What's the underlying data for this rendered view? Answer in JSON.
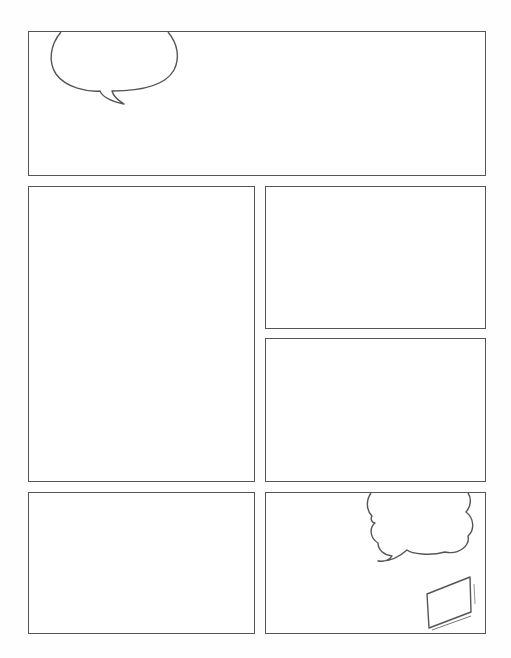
{
  "page": {
    "type": "comic-page-template",
    "background": "#ffffff",
    "line_color": "#555555"
  },
  "panels": [
    {
      "id": "panel-1",
      "x": 28,
      "y": 31,
      "w": 458,
      "h": 145,
      "contents": [
        "speech-bubble"
      ]
    },
    {
      "id": "panel-2",
      "x": 28,
      "y": 186,
      "w": 227,
      "h": 296,
      "contents": []
    },
    {
      "id": "panel-3",
      "x": 265,
      "y": 186,
      "w": 221,
      "h": 143,
      "contents": []
    },
    {
      "id": "panel-4",
      "x": 265,
      "y": 338,
      "w": 221,
      "h": 144,
      "contents": []
    },
    {
      "id": "panel-5",
      "x": 28,
      "y": 492,
      "w": 227,
      "h": 142,
      "contents": []
    },
    {
      "id": "panel-6",
      "x": 265,
      "y": 492,
      "w": 221,
      "h": 142,
      "contents": [
        "cloud-speech-bubble",
        "tablet-sketch"
      ]
    }
  ]
}
